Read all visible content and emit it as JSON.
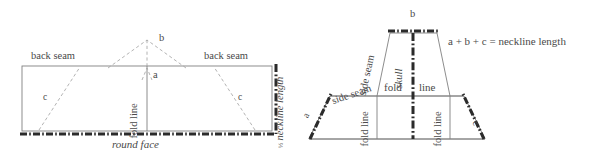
{
  "figure": {
    "ink_color": "#4a4a4a",
    "line_color": "#7a7a7a",
    "dash_color": "#9a9a9a",
    "heavy_color": "#2b2b2b"
  },
  "left_diagram": {
    "name": "flat-pattern-piece",
    "labels": {
      "back_seam_left": "back seam",
      "back_seam_right": "back seam",
      "segment_b": "b",
      "segment_a": "a",
      "segment_c_left": "c",
      "segment_c_right": "c",
      "fold_line": "fold line",
      "neckline_length": "neckline length",
      "neckline_fraction": "½",
      "round_face": "round face"
    }
  },
  "right_diagram": {
    "name": "assembled-hood-shape",
    "labels": {
      "segment_b": "b",
      "segment_a": "a",
      "segment_c": "c",
      "skull": "skull",
      "side_seam_upper": "side seam",
      "side_seam_lower": "side seam",
      "fold_line_center_left": "fold",
      "fold_line_center_right": "line",
      "fold_line_left": "fold line",
      "fold_line_right": "fold line",
      "equation": "a + b + c = neckline length"
    }
  }
}
